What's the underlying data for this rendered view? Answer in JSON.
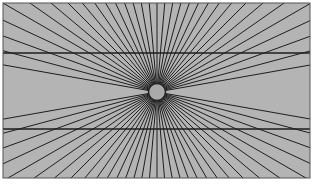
{
  "figure": {
    "title": "Hering illusion",
    "canvas": {
      "width": 314,
      "height": 184
    },
    "frame": {
      "x": 3,
      "y": 3,
      "width": 307,
      "height": 175,
      "fill": "#b4b4b4",
      "stroke": "#555555",
      "stroke_width": 1
    },
    "center": {
      "x": 157,
      "y": 92
    },
    "circle": {
      "radius": 8.5,
      "fill": "#a9a9a9",
      "stroke": "#222222",
      "stroke_width": 1.5
    },
    "rays": {
      "color": "#1e1e1e",
      "stroke_width": 1,
      "angle_step_deg": 5,
      "upper_angles_deg": [
        10,
        15,
        20,
        25,
        30,
        35,
        40,
        45,
        50,
        55,
        60,
        65,
        70,
        75,
        80,
        85,
        90,
        95,
        100,
        105,
        110,
        115,
        120,
        125,
        130,
        135,
        140,
        145,
        150,
        155,
        160,
        165,
        170
      ],
      "lower_angles_deg": [
        190,
        195,
        200,
        205,
        210,
        215,
        220,
        225,
        230,
        235,
        240,
        245,
        250,
        255,
        260,
        265,
        270,
        275,
        280,
        285,
        290,
        295,
        300,
        305,
        310,
        315,
        320,
        325,
        330,
        335,
        340,
        345,
        350
      ]
    },
    "horizontal_lines": [
      {
        "name": "upper-horizontal-line",
        "y": 53,
        "color": "#1e1e1e",
        "stroke_width": 1.3
      },
      {
        "name": "lower-horizontal-line",
        "y": 129,
        "color": "#1e1e1e",
        "stroke_width": 1.3
      }
    ]
  }
}
